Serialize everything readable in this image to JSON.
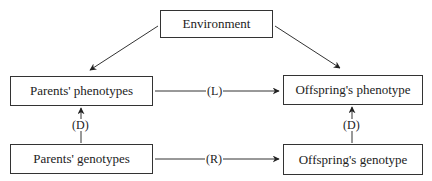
{
  "nodes": {
    "environment": "Environment",
    "parents_phenotypes": "Parents' phenotypes",
    "parents_genotypes": "Parents' genotypes",
    "offspring_phenotype": "Offspring's phenotype",
    "offspring_genotype": "Offspring's genotype"
  },
  "edges": {
    "learning": "(L)",
    "reproduction": "(R)",
    "development_parents": "(D)",
    "development_offspring": "(D)"
  }
}
